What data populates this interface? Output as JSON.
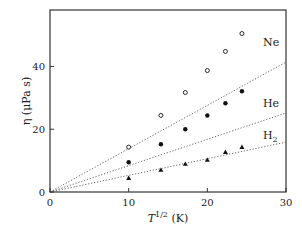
{
  "chart_data": {
    "type": "scatter",
    "title": "",
    "xlabel": "T^{1/2} (K)",
    "ylabel": "η (μPa s)",
    "xlim": [
      0,
      30
    ],
    "ylim": [
      0,
      58
    ],
    "xticks": [
      0,
      10,
      20,
      30
    ],
    "yticks": [
      0,
      20,
      40
    ],
    "grid": false,
    "legend": "inline labels at line ends",
    "series": [
      {
        "name": "Ne",
        "marker": "open-circle",
        "x": [
          10,
          14.1,
          17.2,
          20,
          22.3,
          24.4
        ],
        "y": [
          14.3,
          24.4,
          31.7,
          38.7,
          44.8,
          50.5
        ],
        "fit_slope": 1.38
      },
      {
        "name": "He",
        "marker": "filled-circle",
        "x": [
          10,
          14.1,
          17.2,
          20,
          22.3,
          24.4
        ],
        "y": [
          9.5,
          15.2,
          20.0,
          24.4,
          28.3,
          32.1
        ],
        "fit_slope": 0.84
      },
      {
        "name": "H2",
        "marker": "filled-triangle",
        "x": [
          10,
          14.1,
          17.2,
          20,
          22.3,
          24.4
        ],
        "y": [
          4.4,
          7.0,
          8.9,
          10.2,
          12.7,
          14.3
        ],
        "fit_slope": 0.53
      }
    ]
  },
  "labels": {
    "ne": "Ne",
    "he": "He",
    "h": "H",
    "h_sub": "2",
    "ylabel": "η (μPa s)",
    "xlabel_main": "T",
    "xlabel_sup": "1/2",
    "xlabel_unit": " (K)"
  }
}
